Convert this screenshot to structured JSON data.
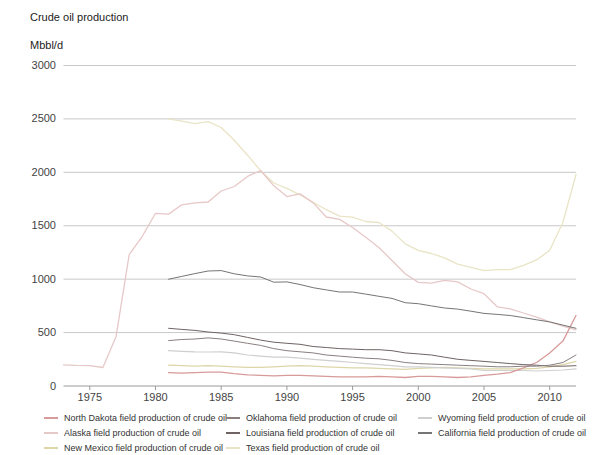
{
  "chart": {
    "title": "Crude oil production",
    "unit": "Mbbl/d"
  },
  "chart_data": {
    "type": "line",
    "title": "Crude oil production",
    "xlabel": "",
    "ylabel": "Mbbl/d",
    "x_range": [
      1973,
      2012
    ],
    "y_range": [
      0,
      3000
    ],
    "x_ticks": [
      1975,
      1980,
      1985,
      1990,
      1995,
      2000,
      2005,
      2010
    ],
    "y_ticks": [
      0,
      500,
      1000,
      1500,
      2000,
      2500,
      3000
    ],
    "grid": "horizontal",
    "legend_position": "bottom",
    "axis_color": "#9a9a9a",
    "grid_color": "#c8c8c8",
    "label_color": "#444444",
    "series": [
      {
        "id": "texas",
        "label": "Texas field production of crude oil",
        "color": "#e9e4c6",
        "width": 1.3,
        "start_year": 1981,
        "values": [
          2500,
          2480,
          2455,
          2475,
          2420,
          2300,
          2160,
          2015,
          1900,
          1850,
          1790,
          1720,
          1650,
          1590,
          1580,
          1540,
          1530,
          1450,
          1330,
          1270,
          1240,
          1200,
          1140,
          1110,
          1080,
          1090,
          1090,
          1130,
          1180,
          1270,
          1530,
          1980
        ]
      },
      {
        "id": "alaska",
        "label": "Alaska field production of crude oil",
        "color": "#e7c8c8",
        "width": 1.3,
        "start_year": 1973,
        "values": [
          198,
          193,
          191,
          173,
          464,
          1229,
          1401,
          1617,
          1609,
          1696,
          1714,
          1722,
          1825,
          1867,
          1962,
          2017,
          1874,
          1773,
          1798,
          1714,
          1582,
          1559,
          1484,
          1393,
          1296,
          1175,
          1050,
          970,
          963,
          988,
          974,
          908,
          864,
          741,
          722,
          683,
          645,
          600,
          561,
          526
        ]
      },
      {
        "id": "new_mexico",
        "label": "New Mexico field production of crude oil",
        "color": "#dcd6a8",
        "width": 1.2,
        "start_year": 1981,
        "values": [
          195,
          190,
          185,
          190,
          185,
          180,
          175,
          175,
          180,
          185,
          190,
          185,
          180,
          175,
          170,
          170,
          165,
          160,
          155,
          165,
          170,
          175,
          170,
          165,
          160,
          160,
          160,
          160,
          165,
          180,
          200,
          230
        ]
      },
      {
        "id": "wyoming",
        "label": "Wyoming field production of crude oil",
        "color": "#cfcfcf",
        "width": 1.2,
        "start_year": 1981,
        "values": [
          330,
          325,
          320,
          318,
          320,
          310,
          290,
          280,
          270,
          270,
          260,
          250,
          240,
          230,
          220,
          210,
          200,
          190,
          180,
          180,
          175,
          170,
          165,
          160,
          145,
          145,
          145,
          145,
          140,
          145,
          150,
          160
        ]
      },
      {
        "id": "north_dakota",
        "label": "North Dakota field production of crude oil",
        "color": "#d89a9a",
        "width": 1.3,
        "start_year": 1981,
        "values": [
          125,
          120,
          125,
          130,
          130,
          115,
          105,
          100,
          95,
          100,
          100,
          95,
          90,
          85,
          85,
          85,
          90,
          85,
          80,
          90,
          90,
          85,
          80,
          85,
          100,
          110,
          125,
          170,
          220,
          310,
          420,
          660
        ]
      },
      {
        "id": "louisiana",
        "label": "Louisiana field production of crude oil",
        "color": "#6f6363",
        "width": 1,
        "start_year": 1981,
        "values": [
          540,
          530,
          520,
          505,
          495,
          480,
          455,
          430,
          410,
          400,
          390,
          370,
          360,
          350,
          345,
          340,
          340,
          330,
          310,
          300,
          290,
          270,
          250,
          240,
          230,
          220,
          210,
          200,
          195,
          185,
          185,
          190
        ]
      },
      {
        "id": "oklahoma",
        "label": "Oklahoma field production of crude oil",
        "color": "#8a7f7f",
        "width": 1,
        "start_year": 1981,
        "values": [
          425,
          435,
          440,
          450,
          440,
          420,
          400,
          380,
          350,
          330,
          320,
          310,
          290,
          280,
          270,
          260,
          255,
          240,
          220,
          210,
          205,
          200,
          195,
          190,
          185,
          180,
          180,
          185,
          185,
          195,
          220,
          290
        ]
      },
      {
        "id": "california",
        "label": "California field production of crude oil",
        "color": "#757575",
        "width": 1,
        "start_year": 1981,
        "values": [
          1000,
          1026,
          1052,
          1076,
          1080,
          1050,
          1031,
          1020,
          972,
          974,
          950,
          920,
          900,
          880,
          880,
          860,
          840,
          820,
          780,
          770,
          750,
          730,
          720,
          700,
          680,
          670,
          660,
          640,
          620,
          600,
          570,
          540
        ]
      }
    ],
    "legend_columns": [
      [
        "north_dakota",
        "alaska",
        "new_mexico"
      ],
      [
        "oklahoma",
        "louisiana",
        "texas"
      ],
      [
        "wyoming",
        "california"
      ]
    ]
  }
}
